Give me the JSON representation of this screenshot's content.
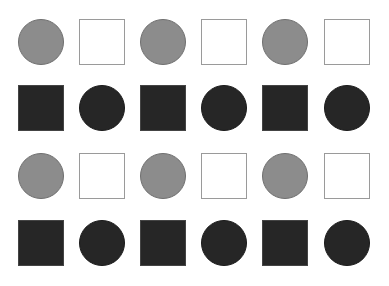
{
  "grid": {
    "columns_x": [
      18,
      79,
      140,
      201,
      262,
      324
    ],
    "rows_y": [
      19,
      85,
      153,
      220
    ],
    "size": 46,
    "colors": {
      "gray_circle": "#8c8c8c",
      "white_square": "#ffffff",
      "square_border": "#9a9a9a",
      "dark_fill": "#262626"
    },
    "rows": [
      [
        "gray-circle",
        "white-square",
        "gray-circle",
        "white-square",
        "gray-circle",
        "white-square"
      ],
      [
        "dark-square",
        "dark-circle",
        "dark-square",
        "dark-circle",
        "dark-square",
        "dark-circle"
      ],
      [
        "gray-circle",
        "white-square",
        "gray-circle",
        "white-square",
        "gray-circle",
        "white-square"
      ],
      [
        "dark-square",
        "dark-circle",
        "dark-square",
        "dark-circle",
        "dark-square",
        "dark-circle"
      ]
    ]
  }
}
